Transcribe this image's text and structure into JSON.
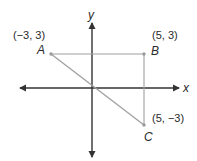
{
  "diagram": {
    "type": "coordinate-plane-triangle",
    "axes": {
      "x_label": "x",
      "y_label": "y",
      "color": "#333333"
    },
    "triangle": {
      "stroke_color": "#a0a0a0",
      "vertices": [
        {
          "name": "A",
          "coords": "(−3, 3)",
          "x": -3,
          "y": 3
        },
        {
          "name": "B",
          "coords": "(5, 3)",
          "x": 5,
          "y": 3
        },
        {
          "name": "C",
          "coords": "(5, −3)",
          "x": 5,
          "y": -3
        }
      ],
      "segments": [
        "AB",
        "BC",
        "AC"
      ]
    }
  }
}
